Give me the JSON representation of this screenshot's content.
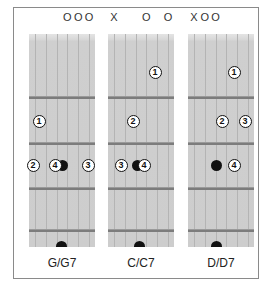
{
  "colors": {
    "frame_border": "#8a8a8a",
    "fretboard": "#cdcdcd",
    "fret": "#7c7c7c",
    "marker": "#111111",
    "background": "#ffffff"
  },
  "chords": [
    {
      "name": "G/G7",
      "top_symbols": [
        {
          "string": 4,
          "symbol": "O"
        },
        {
          "string": 5,
          "symbol": "O"
        },
        {
          "string": 6,
          "symbol": "O"
        }
      ],
      "fingers": [
        {
          "finger": "1",
          "x": 39,
          "y": 121
        },
        {
          "finger": "2",
          "x": 33,
          "y": 165
        },
        {
          "finger": "4",
          "x": 55,
          "y": 165
        },
        {
          "finger": "3",
          "x": 88,
          "y": 165
        }
      ],
      "dots": [
        {
          "type": "dot",
          "x": 62,
          "y": 165
        },
        {
          "type": "half",
          "x": 61,
          "y": 241
        }
      ]
    },
    {
      "name": "C/C7",
      "top_symbols": [
        {
          "string": 1,
          "symbol": "X"
        },
        {
          "string": 4,
          "symbol": "O"
        },
        {
          "string": 6,
          "symbol": "O"
        }
      ],
      "fingers": [
        {
          "finger": "1",
          "x": 155,
          "y": 72
        },
        {
          "finger": "2",
          "x": 133,
          "y": 121
        },
        {
          "finger": "3",
          "x": 121,
          "y": 165
        },
        {
          "finger": "4",
          "x": 144,
          "y": 165
        }
      ],
      "dots": [
        {
          "type": "dot",
          "x": 137,
          "y": 165
        },
        {
          "type": "half",
          "x": 139,
          "y": 241
        }
      ]
    },
    {
      "name": "D/D7",
      "top_symbols": [
        {
          "string": 1,
          "symbol": "X"
        },
        {
          "string": 2,
          "symbol": "O"
        },
        {
          "string": 3,
          "symbol": "O"
        }
      ],
      "fingers": [
        {
          "finger": "1",
          "x": 234,
          "y": 72
        },
        {
          "finger": "2",
          "x": 222,
          "y": 121
        },
        {
          "finger": "3",
          "x": 245,
          "y": 121
        },
        {
          "finger": "4",
          "x": 234,
          "y": 165
        }
      ],
      "dots": [
        {
          "type": "dot",
          "x": 216,
          "y": 165
        },
        {
          "type": "half",
          "x": 216,
          "y": 241
        }
      ]
    }
  ]
}
